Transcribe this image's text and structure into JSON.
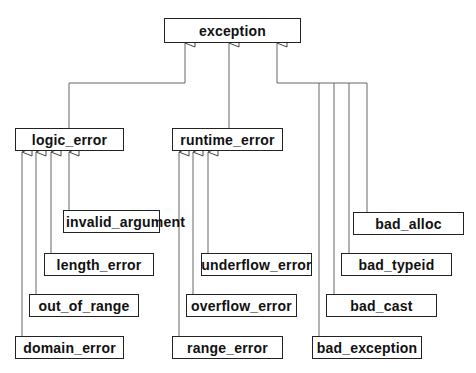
{
  "diagram": {
    "root": {
      "id": "exception",
      "label": "exception"
    },
    "nodes": [
      {
        "id": "exception",
        "label": "exception",
        "parent": null
      },
      {
        "id": "logic_error",
        "label": "logic_error",
        "parent": "exception"
      },
      {
        "id": "runtime_error",
        "label": "runtime_error",
        "parent": "exception"
      },
      {
        "id": "invalid_argument",
        "label": "invalid_argument",
        "parent": "logic_error"
      },
      {
        "id": "length_error",
        "label": "length_error",
        "parent": "logic_error"
      },
      {
        "id": "out_of_range",
        "label": "out_of_range",
        "parent": "logic_error"
      },
      {
        "id": "domain_error",
        "label": "domain_error",
        "parent": "logic_error"
      },
      {
        "id": "underflow_error",
        "label": "underflow_error",
        "parent": "runtime_error"
      },
      {
        "id": "overflow_error",
        "label": "overflow_error",
        "parent": "runtime_error"
      },
      {
        "id": "range_error",
        "label": "range_error",
        "parent": "runtime_error"
      },
      {
        "id": "bad_alloc",
        "label": "bad_alloc",
        "parent": "exception"
      },
      {
        "id": "bad_typeid",
        "label": "bad_typeid",
        "parent": "exception"
      },
      {
        "id": "bad_cast",
        "label": "bad_cast",
        "parent": "exception"
      },
      {
        "id": "bad_exception",
        "label": "bad_exception",
        "parent": "exception"
      }
    ],
    "edge_style": "inheritance (hollow triangle arrowhead)",
    "colors": {
      "line": "#555555",
      "border": "#222222",
      "text": "#111111",
      "background": "#ffffff"
    }
  }
}
